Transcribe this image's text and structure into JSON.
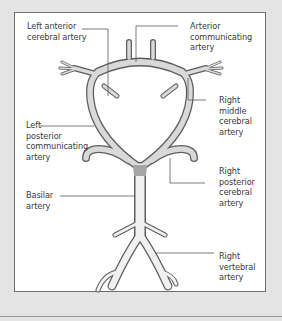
{
  "figure": {
    "colors": {
      "background": "#e4e4e4",
      "panel": "#ffffff",
      "frame": "#6f6f6f",
      "artery_fill": "#d9d9d9",
      "artery_shade": "#8c8c8c",
      "artery_outline": "#6a6a6a",
      "leader_line": "#5a5a5a",
      "text": "#3a3a3a"
    },
    "labels": {
      "left_anterior_cerebral": {
        "line1": "Left anterior",
        "line2": "cerebral artery"
      },
      "anterior_communicating": {
        "line1": "Arterior",
        "line2": "communicating",
        "line3": "artery"
      },
      "left_posterior_communicating": {
        "line1": "Left",
        "line2": "posterior",
        "line3": "communicating",
        "line4": "artery"
      },
      "right_middle_cerebral": {
        "line1": "Right",
        "line2": "middle",
        "line3": "cerebral",
        "line4": "artery"
      },
      "right_posterior_cerebral": {
        "line1": "Right",
        "line2": "posterior",
        "line3": "cerebral",
        "line4": "artery"
      },
      "basilar": {
        "line1": "Basilar",
        "line2": "artery"
      },
      "right_vertebral": {
        "line1": "Right",
        "line2": "vertebral",
        "line3": "artery"
      }
    }
  }
}
